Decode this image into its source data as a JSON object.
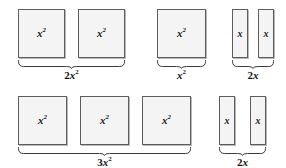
{
  "figure": {
    "kind": "algebra-tiles-diagram",
    "background_color": "#ffffff",
    "tile_fill_color": "#f4f4f4",
    "tile_border_color": "#5d5d5d",
    "tile_shadow_color": "#b9b9b9",
    "text_color": "#141414"
  },
  "groups": [
    {
      "id": "group-2x2",
      "caption_text": "2x2",
      "caption_coefficient": "2",
      "caption_variable": "x",
      "caption_exponent": "2",
      "tile_count": 2,
      "tile_kind": "x-squared",
      "tile_label_variable": "x",
      "tile_label_exponent": "2",
      "x": 18,
      "y": 9,
      "tile_w": 47,
      "tile_h": 49,
      "gap": 13,
      "brace_y": 60,
      "brace_h": 9,
      "caption_y": 70
    },
    {
      "id": "group-x2",
      "caption_text": "x2",
      "caption_coefficient": "",
      "caption_variable": "x",
      "caption_exponent": "2",
      "tile_count": 1,
      "tile_kind": "x-squared",
      "tile_label_variable": "x",
      "tile_label_exponent": "2",
      "x": 157,
      "y": 9,
      "tile_w": 49,
      "tile_h": 49,
      "gap": 13,
      "brace_y": 60,
      "brace_h": 9,
      "caption_y": 70
    },
    {
      "id": "group-2x-top",
      "caption_text": "2x",
      "caption_coefficient": "2",
      "caption_variable": "x",
      "caption_exponent": "",
      "tile_count": 2,
      "tile_kind": "x",
      "tile_label_variable": "x",
      "tile_label_exponent": "",
      "x": 232,
      "y": 9,
      "tile_w": 16,
      "tile_h": 49,
      "gap": 10,
      "brace_y": 60,
      "brace_h": 9,
      "caption_y": 70
    },
    {
      "id": "group-3x2",
      "caption_text": "3x2",
      "caption_coefficient": "3",
      "caption_variable": "x",
      "caption_exponent": "2",
      "tile_count": 3,
      "tile_kind": "x-squared",
      "tile_label_variable": "x",
      "tile_label_exponent": "2",
      "x": 18,
      "y": 96,
      "tile_w": 49,
      "tile_h": 49,
      "gap": 13,
      "brace_y": 147,
      "brace_h": 9,
      "caption_y": 157
    },
    {
      "id": "group-2x-bottom",
      "caption_text": "2x",
      "caption_coefficient": "2",
      "caption_variable": "x",
      "caption_exponent": "",
      "tile_count": 2,
      "tile_kind": "x",
      "tile_label_variable": "x",
      "tile_label_exponent": "",
      "x": 219,
      "y": 96,
      "tile_w": 16,
      "tile_h": 49,
      "gap": 15,
      "brace_y": 147,
      "brace_h": 9,
      "caption_y": 157
    }
  ]
}
